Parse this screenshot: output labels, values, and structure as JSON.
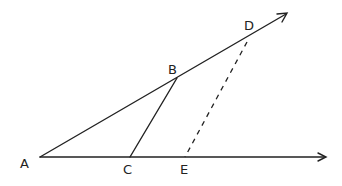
{
  "diagram": {
    "type": "geometry",
    "points": {
      "A": {
        "label": "A",
        "x": 40,
        "y": 157
      },
      "B": {
        "label": "B",
        "x": 177,
        "y": 78
      },
      "C": {
        "label": "C",
        "x": 130,
        "y": 157
      },
      "D": {
        "label": "D",
        "x": 251,
        "y": 34
      },
      "E": {
        "label": "E",
        "x": 185,
        "y": 157
      }
    },
    "segments": [
      {
        "name": "ray-AD",
        "from": "A",
        "through": "D",
        "style": "solid",
        "arrow": true
      },
      {
        "name": "ray-AE",
        "from": "A",
        "through": "E",
        "style": "solid",
        "arrow": true
      },
      {
        "name": "segment-BC",
        "from": "B",
        "to": "C",
        "style": "solid"
      },
      {
        "name": "segment-DE",
        "from": "D",
        "to": "E",
        "style": "dashed"
      }
    ]
  },
  "labels": {
    "A": "A",
    "B": "B",
    "C": "C",
    "D": "D",
    "E": "E"
  }
}
